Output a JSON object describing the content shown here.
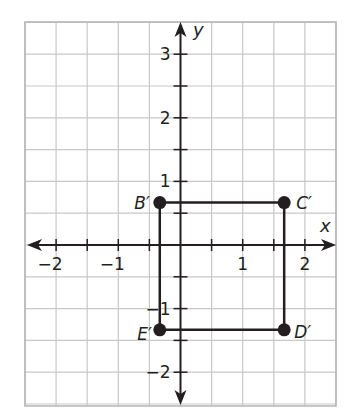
{
  "chart_data": {
    "type": "scatter",
    "title": "",
    "xlabel": "x",
    "ylabel": "y",
    "xlim": [
      -2.5,
      2.5
    ],
    "ylim": [
      -2.5,
      3.5
    ],
    "grid": true,
    "grid_step": 0.5,
    "x_tick_labels": [
      "−2",
      "−1",
      "1",
      "2"
    ],
    "x_tick_values": [
      -2,
      -1,
      1,
      2
    ],
    "y_tick_labels": [
      "3",
      "2",
      "1",
      "−1",
      "−2"
    ],
    "y_tick_values": [
      3,
      2,
      1,
      -1,
      -2
    ],
    "points": [
      {
        "label": "B′",
        "x": -0.333,
        "y": 0.667
      },
      {
        "label": "C′",
        "x": 1.667,
        "y": 0.667
      },
      {
        "label": "D′",
        "x": 1.667,
        "y": -1.333
      },
      {
        "label": "E′",
        "x": -0.333,
        "y": -1.333
      }
    ],
    "polygon": [
      "B′",
      "C′",
      "D′",
      "E′"
    ],
    "shape": "rectangle"
  },
  "colors": {
    "grid": "#c8c8c8",
    "grid_border": "#b5b5b5",
    "axis": "#231f20",
    "shape": "#231f20",
    "point": "#231f20"
  }
}
